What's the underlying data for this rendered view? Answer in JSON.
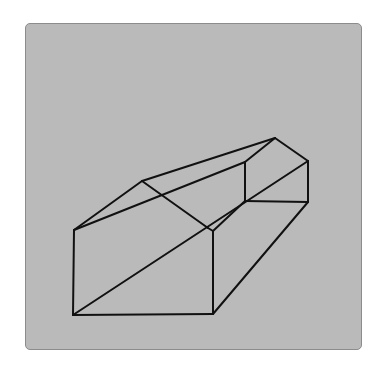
{
  "figure": {
    "panel_color": "#bababa",
    "line_color": "#111111",
    "line_width": 2,
    "vertices": {
      "A": [
        74,
        230
      ],
      "B": [
        73,
        315
      ],
      "C": [
        213,
        314
      ],
      "D": [
        208,
        228
      ],
      "D2": [
        213,
        231
      ],
      "E": [
        142,
        181
      ],
      "F": [
        275,
        138
      ],
      "G": [
        308,
        161
      ],
      "H": [
        308,
        202
      ],
      "I": [
        245,
        162
      ],
      "J": [
        245,
        201
      ]
    },
    "edges": [
      [
        "A",
        "B"
      ],
      [
        "B",
        "C"
      ],
      [
        "C",
        "D2"
      ],
      [
        "D2",
        "D"
      ],
      [
        "A",
        "E"
      ],
      [
        "E",
        "D"
      ],
      [
        "E",
        "F"
      ],
      [
        "F",
        "G"
      ],
      [
        "G",
        "H"
      ],
      [
        "H",
        "C"
      ],
      [
        "A",
        "I"
      ],
      [
        "F",
        "I"
      ],
      [
        "I",
        "J"
      ],
      [
        "J",
        "H"
      ],
      [
        "B",
        "G"
      ],
      [
        "D2",
        "J"
      ]
    ]
  }
}
